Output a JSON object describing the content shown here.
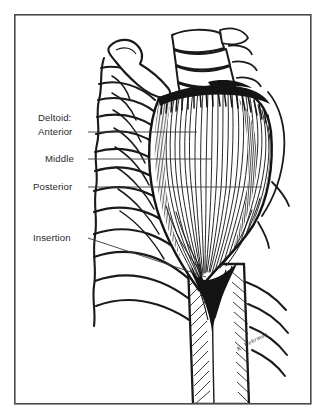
{
  "figure": {
    "background_color": "#ffffff",
    "ink_color": "#1a1a1a",
    "border": {
      "color": "#4a4a4a",
      "x": 14,
      "y": 14,
      "width": 297,
      "height": 390,
      "stroke_width": 1.6
    }
  },
  "labels": [
    {
      "id": "deltoid-heading",
      "text": "Deltoid:",
      "x": 38,
      "y": 121,
      "anchor": "start",
      "has_leader": false
    },
    {
      "id": "anterior",
      "text": "Anterior",
      "x": 38,
      "y": 135,
      "anchor": "start",
      "has_leader": true,
      "leader": {
        "x1": 88,
        "y1": 132,
        "x2": 197,
        "y2": 132
      }
    },
    {
      "id": "middle",
      "text": "Middle",
      "x": 45,
      "y": 162,
      "anchor": "start",
      "has_leader": true,
      "leader": {
        "x1": 88,
        "y1": 159,
        "x2": 212,
        "y2": 159
      }
    },
    {
      "id": "posterior",
      "text": "Posterior",
      "x": 33,
      "y": 190,
      "anchor": "start",
      "has_leader": true,
      "leader": {
        "x1": 88,
        "y1": 187,
        "x2": 262,
        "y2": 187
      }
    },
    {
      "id": "insertion",
      "text": "Insertion",
      "x": 33,
      "y": 241,
      "anchor": "start",
      "has_leader": true,
      "leader": {
        "x1": 88,
        "y1": 238,
        "x2": 206,
        "y2": 277
      }
    }
  ],
  "signature": {
    "text": "K. Wehrman",
    "x": 253,
    "y": 343,
    "rotation": -28
  },
  "anatomy": {
    "parts": [
      {
        "name": "clavicle",
        "description": "S-curved collarbone at upper left of drawing"
      },
      {
        "name": "sternum-vertebrae",
        "description": "Stacked bone segments at top center-right"
      },
      {
        "name": "rib-cage",
        "description": "Series of curved ribs on the left side"
      },
      {
        "name": "deltoid-muscle",
        "description": "Large striated fan-shaped muscle over the shoulder"
      },
      {
        "name": "deltoid-origin",
        "description": "Dark band of muscle origin along the acromion and clavicle"
      },
      {
        "name": "deltoid-insertion",
        "description": "Dark V-shaped tendon converging on the humerus shaft"
      },
      {
        "name": "humerus",
        "description": "Upper arm bone shaft descending to the bottom of the frame"
      },
      {
        "name": "scapula",
        "description": "Shoulder blade edge visible at the right"
      }
    ]
  }
}
